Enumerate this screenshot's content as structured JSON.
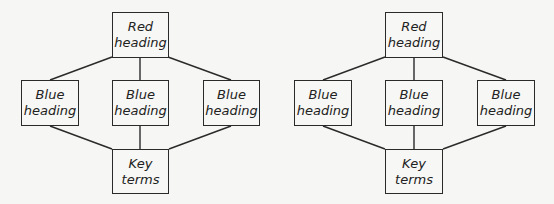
{
  "diagrams": [
    {
      "top": {
        "line1": "Red",
        "line2": "heading"
      },
      "middle": [
        {
          "line1": "Blue",
          "line2": "heading"
        },
        {
          "line1": "Blue",
          "line2": "heading"
        },
        {
          "line1": "Blue",
          "line2": "heading"
        }
      ],
      "bottom": {
        "line1": "Key",
        "line2": "terms"
      }
    },
    {
      "top": {
        "line1": "Red",
        "line2": "heading"
      },
      "middle": [
        {
          "line1": "Blue",
          "line2": "heading"
        },
        {
          "line1": "Blue",
          "line2": "heading"
        },
        {
          "line1": "Blue",
          "line2": "heading"
        }
      ],
      "bottom": {
        "line1": "Key",
        "line2": "terms"
      }
    }
  ]
}
